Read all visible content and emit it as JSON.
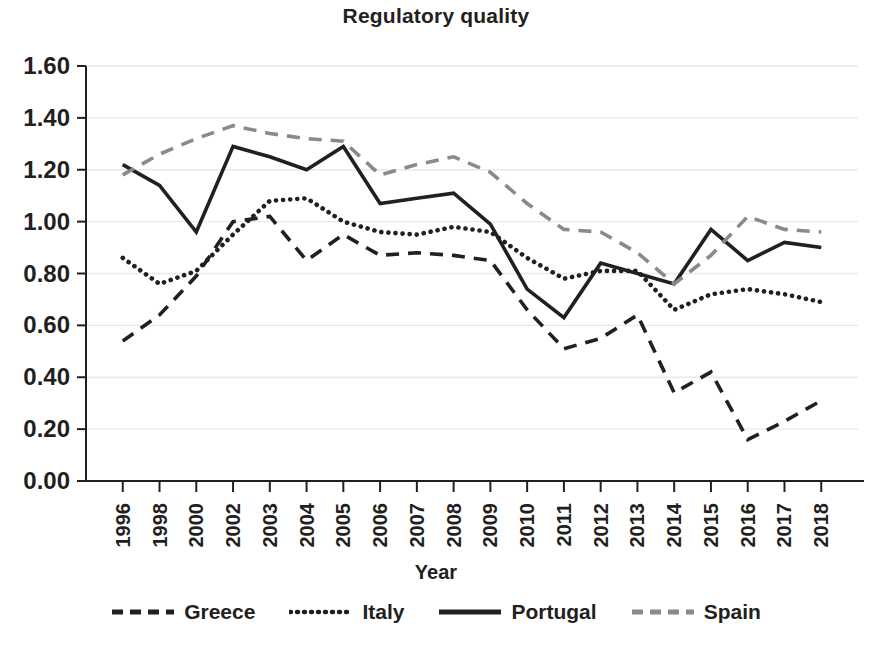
{
  "chart_data": {
    "type": "line",
    "title": "Regulatory quality",
    "xlabel": "Year",
    "ylabel": "",
    "grid": true,
    "legend_position": "bottom",
    "ylim": [
      0.0,
      1.6
    ],
    "ytick_labels": [
      "1.60",
      "1.40",
      "1.20",
      "1.00",
      "0.80",
      "0.60",
      "0.40",
      "0.20",
      "0.00"
    ],
    "ytick_values": [
      1.6,
      1.4,
      1.2,
      1.0,
      0.8,
      0.6,
      0.4,
      0.2,
      0.0
    ],
    "categories": [
      "1996",
      "1998",
      "2000",
      "2002",
      "2003",
      "2004",
      "2005",
      "2006",
      "2007",
      "2008",
      "2009",
      "2010",
      "2011",
      "2012",
      "2013",
      "2014",
      "2015",
      "2016",
      "2017",
      "2018"
    ],
    "series": [
      {
        "name": "Greece",
        "style": "dashed",
        "color": "#231f20",
        "values": [
          0.54,
          0.64,
          0.79,
          1.0,
          1.02,
          0.85,
          0.95,
          0.87,
          0.88,
          0.87,
          0.85,
          0.66,
          0.51,
          0.55,
          0.64,
          0.34,
          0.42,
          0.16,
          0.23,
          0.31
        ]
      },
      {
        "name": "Italy",
        "style": "dotted",
        "color": "#231f20",
        "values": [
          0.86,
          0.76,
          0.81,
          0.95,
          1.08,
          1.09,
          1.0,
          0.96,
          0.95,
          0.98,
          0.96,
          0.86,
          0.78,
          0.81,
          0.81,
          0.66,
          0.72,
          0.74,
          0.72,
          0.69
        ]
      },
      {
        "name": "Portugal",
        "style": "solid",
        "color": "#231f20",
        "values": [
          1.22,
          1.14,
          0.96,
          1.29,
          1.25,
          1.2,
          1.29,
          1.07,
          1.09,
          1.11,
          0.99,
          0.74,
          0.63,
          0.84,
          0.8,
          0.76,
          0.97,
          0.85,
          0.92,
          0.9
        ]
      },
      {
        "name": "Spain",
        "style": "dashed",
        "color": "#8a8a8a",
        "values": [
          1.18,
          1.26,
          1.32,
          1.37,
          1.34,
          1.32,
          1.31,
          1.18,
          1.22,
          1.25,
          1.19,
          1.07,
          0.97,
          0.96,
          0.88,
          0.76,
          0.87,
          1.02,
          0.97,
          0.96
        ]
      }
    ]
  },
  "axes": {
    "x_title": "Year"
  },
  "legend": {
    "items": [
      {
        "label": "Greece"
      },
      {
        "label": "Italy"
      },
      {
        "label": "Portugal"
      },
      {
        "label": "Spain"
      }
    ]
  }
}
